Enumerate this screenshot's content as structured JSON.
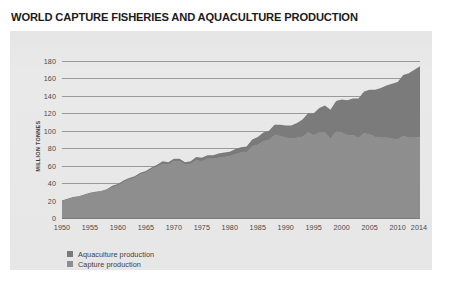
{
  "title": "WORLD CAPTURE FISHERIES AND AQUACULTURE PRODUCTION",
  "legend": {
    "items": [
      {
        "label": "Aquaculture production",
        "color": "#7b7b7b"
      },
      {
        "label": "Capture production",
        "color": "#8f8f8f"
      }
    ]
  },
  "colors": {
    "panel_background": "#e9e9e9",
    "gridline": "#9a9a9a",
    "axis": "#7d7d7d",
    "title_text": "#1b1b1b",
    "tick_text": "#4a4a4a",
    "capture_fill": "#8f8f8f",
    "aquaculture_fill": "#7b7b7b"
  },
  "chart_data": {
    "type": "area",
    "stacked": true,
    "title": "WORLD CAPTURE FISHERIES AND AQUACULTURE PRODUCTION",
    "xlabel": "",
    "ylabel": "MILLION TONNES",
    "ylim": [
      0,
      180
    ],
    "xlim": [
      1950,
      2014
    ],
    "grid": true,
    "legend_position": "bottom-left",
    "ytick_labels": [
      "0",
      "20",
      "40",
      "60",
      "80",
      "100",
      "120",
      "140",
      "160",
      "180"
    ],
    "yticks": [
      0,
      20,
      40,
      60,
      80,
      100,
      120,
      140,
      160,
      180
    ],
    "xtick_labels": [
      "1950",
      "1955",
      "1960",
      "1965",
      "1970",
      "1975",
      "1980",
      "1985",
      "1990",
      "1995",
      "2000",
      "2005",
      "2010",
      "2014"
    ],
    "xticks": [
      1950,
      1955,
      1960,
      1965,
      1970,
      1975,
      1980,
      1985,
      1990,
      1995,
      2000,
      2005,
      2010,
      2014
    ],
    "x": [
      1950,
      1951,
      1952,
      1953,
      1954,
      1955,
      1956,
      1957,
      1958,
      1959,
      1960,
      1961,
      1962,
      1963,
      1964,
      1965,
      1966,
      1967,
      1968,
      1969,
      1970,
      1971,
      1972,
      1973,
      1974,
      1975,
      1976,
      1977,
      1978,
      1979,
      1980,
      1981,
      1982,
      1983,
      1984,
      1985,
      1986,
      1987,
      1988,
      1989,
      1990,
      1991,
      1992,
      1993,
      1994,
      1995,
      1996,
      1997,
      1998,
      1999,
      2000,
      2001,
      2002,
      2003,
      2004,
      2005,
      2006,
      2007,
      2008,
      2009,
      2010,
      2011,
      2012,
      2013,
      2014
    ],
    "series": [
      {
        "name": "Capture production",
        "color": "#8f8f8f",
        "values": [
          19,
          21,
          23,
          24,
          26,
          28,
          29,
          30,
          32,
          35,
          37,
          41,
          44,
          46,
          50,
          52,
          56,
          59,
          62,
          61,
          65,
          65,
          61,
          62,
          66,
          65,
          68,
          68,
          69,
          70,
          71,
          73,
          75,
          75,
          82,
          84,
          88,
          89,
          95,
          94,
          92,
          91,
          92,
          93,
          98,
          95,
          98,
          98,
          91,
          99,
          98,
          95,
          95,
          92,
          97,
          96,
          93,
          92,
          92,
          91,
          90,
          94,
          92,
          92,
          93
        ]
      },
      {
        "name": "Aquaculture production",
        "color": "#7b7b7b",
        "values": [
          1,
          1,
          1,
          1,
          1,
          1,
          1,
          1,
          1,
          2,
          2,
          2,
          2,
          2,
          2,
          2,
          2,
          2,
          3,
          3,
          3,
          3,
          3,
          3,
          4,
          4,
          4,
          4,
          5,
          5,
          5,
          6,
          6,
          7,
          8,
          9,
          10,
          11,
          12,
          13,
          14,
          15,
          17,
          20,
          22,
          25,
          28,
          31,
          33,
          35,
          38,
          40,
          42,
          45,
          48,
          51,
          54,
          57,
          60,
          63,
          66,
          70,
          74,
          78,
          81
        ]
      }
    ],
    "total_values": [
      20,
      22,
      24,
      25,
      27,
      29,
      30,
      31,
      33,
      37,
      39,
      43,
      46,
      48,
      52,
      54,
      58,
      61,
      65,
      64,
      68,
      68,
      64,
      65,
      70,
      69,
      72,
      72,
      74,
      75,
      76,
      79,
      81,
      82,
      90,
      93,
      98,
      100,
      107,
      107,
      106,
      106,
      109,
      113,
      120,
      120,
      126,
      129,
      124,
      134,
      136,
      135,
      137,
      137,
      145,
      147,
      147,
      149,
      152,
      154,
      156,
      164,
      166,
      170,
      174
    ],
    "annotations": []
  }
}
